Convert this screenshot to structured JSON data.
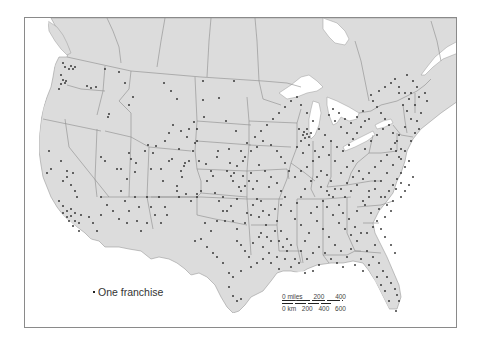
{
  "map": {
    "colors": {
      "land": "#dcdcdc",
      "water": "#ffffff",
      "border": "#8c8c8c",
      "dot": "#1e1e1e",
      "frame": "#8a8a8a"
    },
    "legend": {
      "symbol": "dot",
      "label": "One franchise"
    },
    "scale_bar": {
      "miles_label": "0 miles",
      "miles_ticks": [
        "200",
        "400"
      ],
      "km_label": "0 km",
      "km_ticks": [
        "200",
        "400",
        "600"
      ]
    }
  },
  "dots": [
    [
      62,
      62
    ],
    [
      64,
      66
    ],
    [
      68,
      68
    ],
    [
      70,
      65
    ],
    [
      72,
      68
    ],
    [
      74,
      66
    ],
    [
      60,
      74
    ],
    [
      62,
      79
    ],
    [
      60,
      83
    ],
    [
      64,
      82
    ],
    [
      58,
      88
    ],
    [
      65,
      80
    ],
    [
      86,
      85
    ],
    [
      90,
      87
    ],
    [
      95,
      86
    ],
    [
      104,
      68
    ],
    [
      118,
      71
    ],
    [
      124,
      82
    ],
    [
      132,
      96
    ],
    [
      128,
      104
    ],
    [
      108,
      113
    ],
    [
      107,
      116
    ],
    [
      163,
      82
    ],
    [
      176,
      98
    ],
    [
      170,
      90
    ],
    [
      202,
      80
    ],
    [
      202,
      99
    ],
    [
      218,
      97
    ],
    [
      233,
      80
    ],
    [
      225,
      120
    ],
    [
      235,
      130
    ],
    [
      193,
      121
    ],
    [
      196,
      128
    ],
    [
      196,
      140
    ],
    [
      203,
      116
    ],
    [
      194,
      142
    ],
    [
      178,
      148
    ],
    [
      192,
      150
    ],
    [
      155,
      145
    ],
    [
      147,
      144
    ],
    [
      144,
      150
    ],
    [
      135,
      162
    ],
    [
      130,
      158
    ],
    [
      128,
      152
    ],
    [
      134,
      171
    ],
    [
      126,
      178
    ],
    [
      120,
      168
    ],
    [
      116,
      168
    ],
    [
      150,
      168
    ],
    [
      160,
      168
    ],
    [
      152,
      152
    ],
    [
      162,
      180
    ],
    [
      171,
      158
    ],
    [
      168,
      160
    ],
    [
      180,
      170
    ],
    [
      181,
      176
    ],
    [
      183,
      165
    ],
    [
      184,
      162
    ],
    [
      188,
      160
    ],
    [
      198,
      160
    ],
    [
      205,
      163
    ],
    [
      210,
      170
    ],
    [
      212,
      175
    ],
    [
      206,
      180
    ],
    [
      200,
      190
    ],
    [
      196,
      193
    ],
    [
      185,
      193
    ],
    [
      176,
      185
    ],
    [
      176,
      190
    ],
    [
      178,
      196
    ],
    [
      190,
      200
    ],
    [
      196,
      196
    ],
    [
      216,
      156
    ],
    [
      217,
      150
    ],
    [
      228,
      148
    ],
    [
      229,
      162
    ],
    [
      233,
      172
    ],
    [
      232,
      180
    ],
    [
      238,
      186
    ],
    [
      240,
      190
    ],
    [
      236,
      198
    ],
    [
      230,
      205
    ],
    [
      226,
      210
    ],
    [
      224,
      220
    ],
    [
      232,
      220
    ],
    [
      236,
      228
    ],
    [
      244,
      222
    ],
    [
      246,
      212
    ],
    [
      250,
      214
    ],
    [
      252,
      204
    ],
    [
      256,
      198
    ],
    [
      260,
      200
    ],
    [
      262,
      210
    ],
    [
      258,
      216
    ],
    [
      265,
      224
    ],
    [
      260,
      232
    ],
    [
      270,
      240
    ],
    [
      268,
      252
    ],
    [
      262,
      258
    ],
    [
      256,
      262
    ],
    [
      250,
      266
    ],
    [
      240,
      270
    ],
    [
      232,
      276
    ],
    [
      228,
      286
    ],
    [
      232,
      295
    ],
    [
      236,
      300
    ],
    [
      240,
      298
    ],
    [
      228,
      272
    ],
    [
      222,
      262
    ],
    [
      216,
      256
    ],
    [
      212,
      252
    ],
    [
      206,
      246
    ],
    [
      200,
      238
    ],
    [
      194,
      240
    ],
    [
      210,
      230
    ],
    [
      204,
      222
    ],
    [
      216,
      220
    ],
    [
      222,
      210
    ],
    [
      218,
      200
    ],
    [
      222,
      196
    ],
    [
      214,
      192
    ],
    [
      252,
      188
    ],
    [
      256,
      180
    ],
    [
      250,
      172
    ],
    [
      258,
      164
    ],
    [
      264,
      170
    ],
    [
      270,
      176
    ],
    [
      268,
      186
    ],
    [
      276,
      182
    ],
    [
      280,
      190
    ],
    [
      284,
      196
    ],
    [
      280,
      204
    ],
    [
      274,
      208
    ],
    [
      268,
      214
    ],
    [
      276,
      220
    ],
    [
      280,
      230
    ],
    [
      286,
      238
    ],
    [
      290,
      244
    ],
    [
      286,
      250
    ],
    [
      284,
      258
    ],
    [
      294,
      258
    ],
    [
      300,
      250
    ],
    [
      304,
      240
    ],
    [
      308,
      232
    ],
    [
      300,
      224
    ],
    [
      294,
      218
    ],
    [
      290,
      210
    ],
    [
      296,
      202
    ],
    [
      300,
      196
    ],
    [
      304,
      188
    ],
    [
      310,
      180
    ],
    [
      316,
      176
    ],
    [
      320,
      170
    ],
    [
      326,
      174
    ],
    [
      330,
      180
    ],
    [
      334,
      188
    ],
    [
      328,
      194
    ],
    [
      322,
      200
    ],
    [
      316,
      206
    ],
    [
      310,
      212
    ],
    [
      316,
      220
    ],
    [
      322,
      228
    ],
    [
      328,
      236
    ],
    [
      334,
      244
    ],
    [
      340,
      250
    ],
    [
      346,
      256
    ],
    [
      350,
      248
    ],
    [
      356,
      240
    ],
    [
      360,
      232
    ],
    [
      354,
      226
    ],
    [
      348,
      218
    ],
    [
      342,
      212
    ],
    [
      338,
      204
    ],
    [
      344,
      196
    ],
    [
      350,
      190
    ],
    [
      356,
      184
    ],
    [
      362,
      178
    ],
    [
      368,
      172
    ],
    [
      374,
      166
    ],
    [
      380,
      160
    ],
    [
      386,
      154
    ],
    [
      390,
      148
    ],
    [
      394,
      142
    ],
    [
      392,
      132
    ],
    [
      388,
      124
    ],
    [
      384,
      118
    ],
    [
      380,
      112
    ],
    [
      376,
      106
    ],
    [
      372,
      100
    ],
    [
      370,
      94
    ],
    [
      378,
      90
    ],
    [
      384,
      86
    ],
    [
      390,
      82
    ],
    [
      394,
      78
    ],
    [
      398,
      92
    ],
    [
      402,
      104
    ],
    [
      406,
      110
    ],
    [
      410,
      118
    ],
    [
      404,
      126
    ],
    [
      398,
      134
    ],
    [
      396,
      140
    ],
    [
      400,
      148
    ],
    [
      398,
      156
    ],
    [
      392,
      164
    ],
    [
      386,
      172
    ],
    [
      380,
      180
    ],
    [
      374,
      188
    ],
    [
      368,
      196
    ],
    [
      364,
      204
    ],
    [
      370,
      212
    ],
    [
      376,
      220
    ],
    [
      380,
      228
    ],
    [
      384,
      236
    ],
    [
      390,
      244
    ],
    [
      394,
      252
    ],
    [
      372,
      256
    ],
    [
      378,
      262
    ],
    [
      382,
      270
    ],
    [
      386,
      276
    ],
    [
      390,
      282
    ],
    [
      394,
      288
    ],
    [
      396,
      294
    ],
    [
      398,
      300
    ],
    [
      376,
      276
    ],
    [
      384,
      290
    ],
    [
      395,
      310
    ],
    [
      388,
      300
    ],
    [
      380,
      284
    ],
    [
      300,
      140
    ],
    [
      296,
      146
    ],
    [
      302,
      152
    ],
    [
      308,
      144
    ],
    [
      314,
      150
    ],
    [
      318,
      156
    ],
    [
      312,
      160
    ],
    [
      306,
      166
    ],
    [
      300,
      170
    ],
    [
      294,
      176
    ],
    [
      288,
      170
    ],
    [
      284,
      162
    ],
    [
      280,
      156
    ],
    [
      276,
      150
    ],
    [
      270,
      144
    ],
    [
      262,
      140
    ],
    [
      256,
      146
    ],
    [
      250,
      150
    ],
    [
      244,
      156
    ],
    [
      240,
      150
    ],
    [
      246,
      142
    ],
    [
      254,
      136
    ],
    [
      260,
      130
    ],
    [
      266,
      124
    ],
    [
      272,
      118
    ],
    [
      278,
      112
    ],
    [
      284,
      106
    ],
    [
      290,
      100
    ],
    [
      296,
      96
    ],
    [
      300,
      104
    ],
    [
      306,
      112
    ],
    [
      312,
      120
    ],
    [
      318,
      128
    ],
    [
      324,
      134
    ],
    [
      330,
      140
    ],
    [
      336,
      146
    ],
    [
      342,
      150
    ],
    [
      348,
      144
    ],
    [
      352,
      138
    ],
    [
      356,
      132
    ],
    [
      360,
      126
    ],
    [
      364,
      120
    ],
    [
      346,
      132
    ],
    [
      340,
      126
    ],
    [
      334,
      120
    ],
    [
      328,
      114
    ],
    [
      332,
      108
    ],
    [
      338,
      112
    ],
    [
      344,
      118
    ],
    [
      350,
      122
    ],
    [
      356,
      116
    ],
    [
      362,
      110
    ],
    [
      368,
      118
    ],
    [
      352,
      160
    ],
    [
      346,
      166
    ],
    [
      340,
      172
    ],
    [
      334,
      160
    ],
    [
      328,
      154
    ],
    [
      322,
      146
    ],
    [
      364,
      148
    ],
    [
      370,
      140
    ],
    [
      376,
      134
    ],
    [
      382,
      128
    ],
    [
      358,
      170
    ],
    [
      352,
      176
    ],
    [
      346,
      182
    ],
    [
      340,
      188
    ],
    [
      384,
      196
    ],
    [
      388,
      190
    ],
    [
      392,
      184
    ],
    [
      396,
      178
    ],
    [
      400,
      172
    ],
    [
      404,
      166
    ],
    [
      408,
      160
    ],
    [
      404,
      150
    ],
    [
      410,
      140
    ],
    [
      414,
      132
    ],
    [
      418,
      128
    ],
    [
      416,
      120
    ],
    [
      420,
      112
    ],
    [
      414,
      104
    ],
    [
      408,
      98
    ],
    [
      404,
      92
    ],
    [
      398,
      86
    ],
    [
      302,
      134
    ],
    [
      306,
      128
    ],
    [
      298,
      128
    ],
    [
      303,
      131
    ],
    [
      306,
      133
    ],
    [
      304,
      137
    ],
    [
      308,
      136
    ],
    [
      310,
      132
    ],
    [
      226,
      170
    ],
    [
      230,
      175
    ],
    [
      236,
      165
    ],
    [
      242,
      175
    ],
    [
      248,
      180
    ],
    [
      244,
      185
    ],
    [
      242,
      160
    ],
    [
      236,
      240
    ],
    [
      240,
      244
    ],
    [
      244,
      250
    ],
    [
      248,
      256
    ],
    [
      252,
      242
    ],
    [
      258,
      236
    ],
    [
      262,
      246
    ],
    [
      266,
      236
    ],
    [
      274,
      230
    ],
    [
      278,
      240
    ],
    [
      282,
      246
    ],
    [
      276,
      256
    ],
    [
      270,
      262
    ],
    [
      278,
      268
    ],
    [
      290,
      266
    ],
    [
      298,
      262
    ],
    [
      306,
      258
    ],
    [
      312,
      252
    ],
    [
      318,
      246
    ],
    [
      324,
      252
    ],
    [
      330,
      258
    ],
    [
      336,
      262
    ],
    [
      342,
      266
    ],
    [
      318,
      264
    ],
    [
      312,
      270
    ],
    [
      304,
      272
    ],
    [
      354,
      264
    ],
    [
      360,
      258
    ],
    [
      366,
      250
    ],
    [
      362,
      270
    ],
    [
      368,
      264
    ],
    [
      374,
      244
    ],
    [
      320,
      186
    ],
    [
      326,
      190
    ],
    [
      332,
      196
    ],
    [
      326,
      206
    ],
    [
      332,
      214
    ],
    [
      338,
      222
    ],
    [
      344,
      228
    ],
    [
      350,
      234
    ],
    [
      356,
      210
    ],
    [
      362,
      200
    ],
    [
      368,
      190
    ],
    [
      374,
      180
    ],
    [
      380,
      196
    ],
    [
      386,
      204
    ],
    [
      392,
      200
    ],
    [
      390,
      210
    ],
    [
      384,
      216
    ],
    [
      378,
      208
    ],
    [
      372,
      226
    ],
    [
      366,
      232
    ],
    [
      395,
      188
    ],
    [
      400,
      196
    ],
    [
      404,
      190
    ],
    [
      408,
      184
    ],
    [
      412,
      176
    ],
    [
      400,
      182
    ],
    [
      395,
      150
    ],
    [
      400,
      158
    ],
    [
      418,
      96
    ],
    [
      424,
      92
    ],
    [
      426,
      100
    ],
    [
      410,
      92
    ],
    [
      416,
      86
    ],
    [
      412,
      80
    ],
    [
      406,
      74
    ],
    [
      120,
      190
    ],
    [
      124,
      200
    ],
    [
      128,
      210
    ],
    [
      134,
      196
    ],
    [
      138,
      206
    ],
    [
      146,
      196
    ],
    [
      150,
      206
    ],
    [
      158,
      196
    ],
    [
      164,
      206
    ],
    [
      166,
      214
    ],
    [
      160,
      222
    ],
    [
      154,
      214
    ],
    [
      146,
      222
    ],
    [
      140,
      230
    ],
    [
      136,
      220
    ],
    [
      126,
      222
    ],
    [
      118,
      218
    ],
    [
      112,
      210
    ],
    [
      106,
      204
    ],
    [
      100,
      196
    ],
    [
      58,
      200
    ],
    [
      62,
      205
    ],
    [
      66,
      210
    ],
    [
      70,
      215
    ],
    [
      74,
      220
    ],
    [
      78,
      222
    ],
    [
      62,
      212
    ],
    [
      66,
      216
    ],
    [
      70,
      208
    ],
    [
      74,
      212
    ],
    [
      68,
      220
    ],
    [
      72,
      225
    ],
    [
      78,
      230
    ],
    [
      80,
      214
    ],
    [
      88,
      216
    ],
    [
      92,
      222
    ],
    [
      96,
      230
    ],
    [
      100,
      214
    ],
    [
      62,
      180
    ],
    [
      66,
      176
    ],
    [
      70,
      184
    ],
    [
      74,
      190
    ],
    [
      76,
      196
    ],
    [
      50,
      168
    ],
    [
      46,
      172
    ],
    [
      60,
      160
    ],
    [
      66,
      170
    ],
    [
      72,
      172
    ],
    [
      48,
      150
    ],
    [
      100,
      156
    ],
    [
      104,
      160
    ],
    [
      164,
      140
    ],
    [
      168,
      132
    ],
    [
      172,
      124
    ],
    [
      180,
      130
    ],
    [
      186,
      136
    ],
    [
      188,
      128
    ]
  ]
}
